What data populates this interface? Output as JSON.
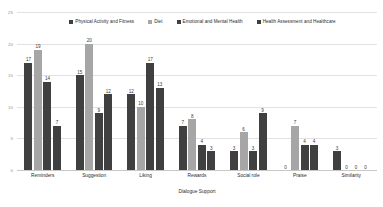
{
  "chart_data": {
    "type": "bar",
    "title": "",
    "xlabel": "Dialogue Support",
    "ylabel": "",
    "ylim": [
      0,
      25
    ],
    "ytick_step": 5,
    "yticks": [
      "0",
      "5",
      "10",
      "15",
      "20",
      "25"
    ],
    "grid": true,
    "legend_position": "top",
    "categories": [
      "Reminders",
      "Suggestion",
      "Liking",
      "Rewards",
      "Social role",
      "Praise",
      "Similarity"
    ],
    "series": [
      {
        "name": "Physical Activity and Fitness",
        "color": "#404040",
        "values": [
          17,
          15,
          12,
          7,
          3,
          0,
          3
        ]
      },
      {
        "name": "Diet",
        "color": "#a6a6a6",
        "values": [
          19,
          20,
          10,
          8,
          6,
          7,
          0
        ]
      },
      {
        "name": "Emotional and Mental Health",
        "color": "#404040",
        "values": [
          14,
          9,
          17,
          4,
          3,
          4,
          0
        ]
      },
      {
        "name": "Health Assessment and Healthcare",
        "color": "#404040",
        "values": [
          7,
          12,
          13,
          3,
          9,
          4,
          0
        ]
      }
    ]
  }
}
